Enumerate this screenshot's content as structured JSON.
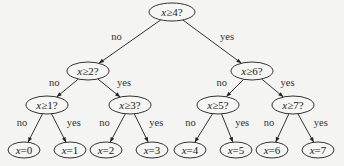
{
  "diagram": {
    "type": "binary-decision-tree",
    "nodes": [
      {
        "id": "n0",
        "var": "x",
        "op": "≥",
        "value": "4?",
        "cx": 172,
        "cy": 12,
        "rx": 23,
        "ry": 9
      },
      {
        "id": "n1",
        "var": "x",
        "op": "≥",
        "value": "2?",
        "cx": 88,
        "cy": 71,
        "rx": 21,
        "ry": 9
      },
      {
        "id": "n2",
        "var": "x",
        "op": "≥",
        "value": "6?",
        "cx": 252,
        "cy": 71,
        "rx": 21,
        "ry": 9
      },
      {
        "id": "n3",
        "var": "x",
        "op": "≥",
        "value": "1?",
        "cx": 47,
        "cy": 105,
        "rx": 21,
        "ry": 9
      },
      {
        "id": "n4",
        "var": "x",
        "op": "≥",
        "value": "3?",
        "cx": 130,
        "cy": 105,
        "rx": 21,
        "ry": 9
      },
      {
        "id": "n5",
        "var": "x",
        "op": "≥",
        "value": "5?",
        "cx": 218,
        "cy": 105,
        "rx": 21,
        "ry": 9
      },
      {
        "id": "n6",
        "var": "x",
        "op": "≥",
        "value": "7?",
        "cx": 293,
        "cy": 105,
        "rx": 21,
        "ry": 9
      },
      {
        "id": "l0",
        "var": "x",
        "op": "=",
        "value": "0",
        "cx": 24,
        "cy": 150,
        "rx": 16,
        "ry": 8
      },
      {
        "id": "l1",
        "var": "x",
        "op": "=",
        "value": "1",
        "cx": 70,
        "cy": 150,
        "rx": 16,
        "ry": 8
      },
      {
        "id": "l2",
        "var": "x",
        "op": "=",
        "value": "2",
        "cx": 106,
        "cy": 150,
        "rx": 16,
        "ry": 8
      },
      {
        "id": "l3",
        "var": "x",
        "op": "=",
        "value": "3",
        "cx": 152,
        "cy": 150,
        "rx": 16,
        "ry": 8
      },
      {
        "id": "l4",
        "var": "x",
        "op": "=",
        "value": "4",
        "cx": 190,
        "cy": 150,
        "rx": 16,
        "ry": 8
      },
      {
        "id": "l5",
        "var": "x",
        "op": "=",
        "value": "5",
        "cx": 236,
        "cy": 150,
        "rx": 16,
        "ry": 8
      },
      {
        "id": "l6",
        "var": "x",
        "op": "=",
        "value": "6",
        "cx": 272,
        "cy": 150,
        "rx": 16,
        "ry": 8
      },
      {
        "id": "l7",
        "var": "x",
        "op": "=",
        "value": "7",
        "cx": 318,
        "cy": 150,
        "rx": 16,
        "ry": 8
      }
    ],
    "edges": [
      {
        "from": "n0",
        "to": "n1",
        "label": "no"
      },
      {
        "from": "n0",
        "to": "n2",
        "label": "yes"
      },
      {
        "from": "n1",
        "to": "n3",
        "label": "no"
      },
      {
        "from": "n1",
        "to": "n4",
        "label": "yes"
      },
      {
        "from": "n2",
        "to": "n5",
        "label": "no"
      },
      {
        "from": "n2",
        "to": "n6",
        "label": "yes"
      },
      {
        "from": "n3",
        "to": "l0",
        "label": "no"
      },
      {
        "from": "n3",
        "to": "l1",
        "label": "yes"
      },
      {
        "from": "n4",
        "to": "l2",
        "label": "no"
      },
      {
        "from": "n4",
        "to": "l3",
        "label": "yes"
      },
      {
        "from": "n5",
        "to": "l4",
        "label": "no"
      },
      {
        "from": "n5",
        "to": "l5",
        "label": "yes"
      },
      {
        "from": "n6",
        "to": "l6",
        "label": "no"
      },
      {
        "from": "n6",
        "to": "l7",
        "label": "yes"
      }
    ]
  }
}
